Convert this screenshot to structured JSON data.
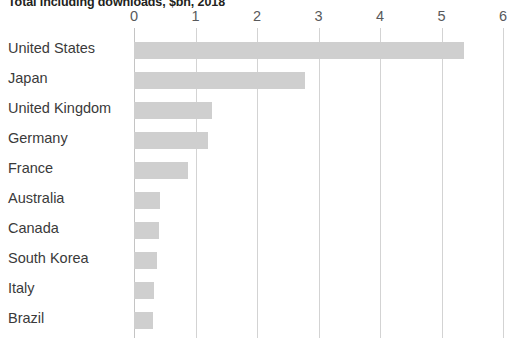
{
  "chart": {
    "title": "Total including downloads, $bn, 2018"
  },
  "chart_data": {
    "type": "bar",
    "orientation": "horizontal",
    "title": "Total including downloads, $bn, 2018",
    "xlabel": "",
    "ylabel": "",
    "xlim": [
      0,
      6
    ],
    "xticks": [
      0,
      1,
      2,
      3,
      4,
      5,
      6
    ],
    "xtick_labels": [
      "0",
      "1",
      "2",
      "3",
      "4",
      "5",
      "6"
    ],
    "grid": "vertical",
    "legend": "none",
    "bar_color": "#cfcfcf",
    "categories": [
      "United States",
      "Japan",
      "United Kingdom",
      "Germany",
      "France",
      "Australia",
      "Canada",
      "South Korea",
      "Italy",
      "Brazil"
    ],
    "values": [
      5.37,
      2.78,
      1.27,
      1.2,
      0.88,
      0.42,
      0.41,
      0.37,
      0.33,
      0.31
    ]
  }
}
